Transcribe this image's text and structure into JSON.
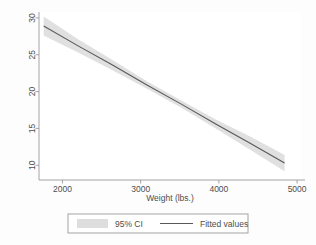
{
  "chart_data": {
    "type": "line",
    "title": "",
    "subtitle": "",
    "xlabel": "Weight (lbs.)",
    "ylabel": "",
    "xlim": [
      1700,
      5050
    ],
    "ylim": [
      8.0,
      30.8
    ],
    "xticks": [
      2000,
      3000,
      4000,
      5000
    ],
    "xtick_labels": [
      "2000",
      "3000",
      "4000",
      "5000"
    ],
    "yticks": [
      10,
      15,
      20,
      25,
      30
    ],
    "ytick_labels": [
      "10",
      "15",
      "20",
      "25",
      "30"
    ],
    "grid": false,
    "legend_position": "bottom",
    "ytick_label_rotation": -90,
    "series": [
      {
        "name": "Fitted values",
        "type": "line",
        "color": "#58595b",
        "x": [
          1760,
          2200,
          2640,
          3080,
          3520,
          3960,
          4400,
          4840
        ],
        "values": [
          28.9,
          26.2,
          23.6,
          20.9,
          18.3,
          15.6,
          13.0,
          10.3
        ]
      },
      {
        "name": "95% CI",
        "type": "band",
        "color": "#d9d9d9",
        "x": [
          1760,
          2200,
          2640,
          3080,
          3520,
          3960,
          4400,
          4840
        ],
        "lower": [
          27.6,
          25.3,
          22.9,
          20.4,
          17.8,
          15.0,
          12.1,
          9.2
        ],
        "upper": [
          30.2,
          27.1,
          24.3,
          21.4,
          18.8,
          16.2,
          13.9,
          11.4
        ]
      }
    ],
    "legend_entries": [
      {
        "label": "95% CI",
        "marker": "swatch",
        "color": "#d9d9d9"
      },
      {
        "label": "Fitted values",
        "marker": "line",
        "color": "#58595b"
      }
    ],
    "annotations": []
  },
  "figure": {
    "background_color": "#fdfdfd",
    "plot_background_color": "#ffffff",
    "axis_color": "#9a9a9a",
    "text_color": "#4d4d4d",
    "legend_border_color": "#9a9a9a"
  }
}
